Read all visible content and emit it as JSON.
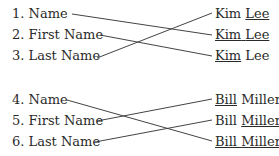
{
  "groups": [
    {
      "left": [
        {
          "num": "1.",
          "label": "Name",
          "y": 6
        },
        {
          "num": "2.",
          "label": "First Name",
          "y": 27
        },
        {
          "num": "3.",
          "label": "Last Name",
          "y": 48
        }
      ],
      "right": [
        {
          "first": "Kim",
          "last": "Lee",
          "underline": "last",
          "y": 6
        },
        {
          "first": "Kim",
          "last": "Lee",
          "underline": "both",
          "y": 27
        },
        {
          "first": "Kim",
          "last": "Lee",
          "underline": "first",
          "y": 48
        }
      ],
      "links": [
        [
          0,
          1
        ],
        [
          1,
          2
        ],
        [
          2,
          0
        ]
      ]
    },
    {
      "left": [
        {
          "num": "4.",
          "label": "Name",
          "y": 92
        },
        {
          "num": "5.",
          "label": "First Name",
          "y": 113
        },
        {
          "num": "6.",
          "label": "Last Name",
          "y": 134
        }
      ],
      "right": [
        {
          "first": "Bill",
          "last": "Miller",
          "underline": "first",
          "y": 92
        },
        {
          "first": "Bill",
          "last": "Miller",
          "underline": "last",
          "y": 113
        },
        {
          "first": "Bill",
          "last": "Miller",
          "underline": "both",
          "y": 134
        }
      ],
      "links": [
        [
          0,
          2
        ],
        [
          1,
          0
        ],
        [
          2,
          1
        ]
      ]
    }
  ],
  "colors": {
    "text": "#2a2a2a",
    "line": "#444444"
  }
}
